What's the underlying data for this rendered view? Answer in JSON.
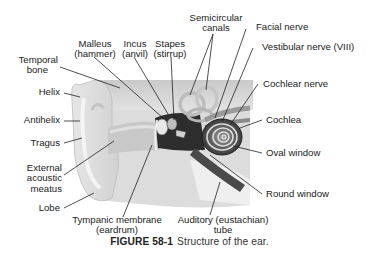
{
  "figure": {
    "number": "FIGURE 58-1",
    "caption": "Structure of the ear."
  },
  "labels": {
    "malleus": [
      "Malleus",
      "(hammer)"
    ],
    "incus": [
      "Incus",
      "(anvil)"
    ],
    "stapes": [
      "Stapes",
      "(stirrup)"
    ],
    "semicircular_canals": [
      "Semicircular",
      "canals"
    ],
    "facial_nerve": "Facial nerve",
    "vestibular_nerve": "Vestibular nerve (VIII)",
    "temporal_bone": [
      "Temporal",
      "bone"
    ],
    "helix": "Helix",
    "antihelix": "Antihelix",
    "cochlear_nerve": "Cochlear nerve",
    "cochlea": "Cochlea",
    "tragus": "Tragus",
    "external_acoustic_meatus": [
      "External",
      "acoustic",
      "meatus"
    ],
    "oval_window": "Oval window",
    "round_window": "Round window",
    "lobe": "Lobe",
    "tympanic_membrane": [
      "Tympanic membrane",
      "(eardrum)"
    ],
    "auditory_tube": [
      "Auditory (eustachian)",
      "tube"
    ]
  }
}
